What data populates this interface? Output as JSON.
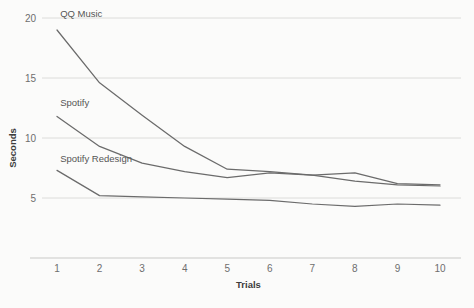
{
  "chart_data": {
    "type": "line",
    "title": "",
    "xlabel": "Trials",
    "ylabel": "Seconds",
    "categories": [
      1,
      2,
      3,
      4,
      5,
      6,
      7,
      8,
      9,
      10
    ],
    "x": [
      1,
      2,
      3,
      4,
      5,
      6,
      7,
      8,
      9,
      10
    ],
    "xlim": [
      1,
      10
    ],
    "ylim": [
      3.4,
      20.6
    ],
    "yticks": [
      5,
      10,
      15,
      20
    ],
    "xticks": [
      1,
      2,
      3,
      4,
      5,
      6,
      7,
      8,
      9,
      10
    ],
    "grid": "horizontal",
    "legend": "inline-labels",
    "series": [
      {
        "name": "QQ Music",
        "color": "#6b6b6b",
        "values": [
          19.0,
          14.6,
          11.9,
          9.3,
          7.4,
          7.2,
          6.9,
          6.4,
          6.1,
          6.0
        ],
        "label_x": 1.05,
        "label_y": 20.1
      },
      {
        "name": "Spotify",
        "color": "#6b6b6b",
        "values": [
          11.8,
          9.3,
          7.9,
          7.2,
          6.7,
          7.1,
          6.9,
          7.1,
          6.2,
          6.1
        ],
        "label_x": 1.05,
        "label_y": 12.7
      },
      {
        "name": "Spotify Redesign",
        "color": "#6b6b6b",
        "values": [
          7.3,
          5.2,
          5.1,
          5.0,
          4.9,
          4.8,
          4.5,
          4.3,
          4.5,
          4.4
        ],
        "label_x": 1.05,
        "label_y": 8.0
      }
    ]
  },
  "axes": {
    "y_title": "Seconds",
    "x_title": "Trials",
    "y_tick_labels": [
      "20",
      "15",
      "10",
      "5"
    ],
    "x_tick_labels": [
      "1",
      "2",
      "3",
      "4",
      "5",
      "6",
      "7",
      "8",
      "9",
      "10"
    ]
  },
  "series_labels": {
    "qq_music": "QQ Music",
    "spotify": "Spotify",
    "spotify_redesign": "Spotify Redesign"
  },
  "colors": {
    "line": "#6b6b6b",
    "grid": "#dcdcda",
    "axis": "#c9c9c7",
    "tick_text": "#6e6e6e",
    "title_text": "#3c3c3c",
    "label_text": "#555555",
    "background": "#fbfbfa"
  }
}
